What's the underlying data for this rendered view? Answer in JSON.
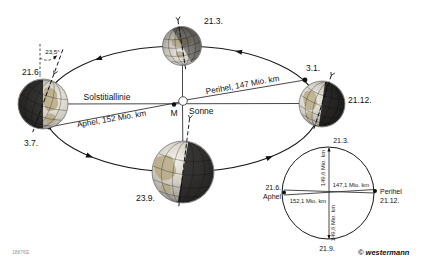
{
  "orbit": {
    "dates": {
      "june": "21.6.",
      "march": "21.3.",
      "january": "3.1.",
      "december": "21.12.",
      "july": "3.7.",
      "september": "23.9."
    },
    "tilt_angle": "23,5°",
    "solstice_line": "Solstitiallinie",
    "perihelion_line": "Perihel, 147 Mio. km",
    "aphelion_line": "Aphel, 152 Mio. km",
    "center_label": "M",
    "sun_label": "Sonne"
  },
  "distance_circle": {
    "march": "21.3.",
    "june": "21.6.",
    "june_role": "Aphel",
    "perihel_role": "Perihel",
    "december": "21.12.",
    "september": "21.9.",
    "radius_top": "149,6 Mio. km",
    "radius_bottom": "149,6 Mio. km",
    "perihel_distance": "147,1 Mio. km",
    "aphel_distance": "152,1 Mio. km"
  },
  "footer": {
    "code": "18876E",
    "credit": "© westermann"
  }
}
